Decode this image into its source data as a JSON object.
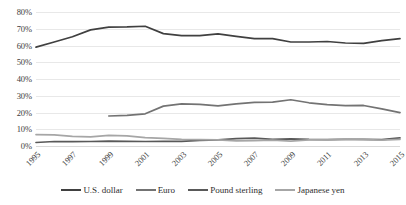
{
  "chart_data": {
    "type": "line",
    "title": "",
    "xlabel": "",
    "ylabel": "",
    "ylim": [
      0,
      80
    ],
    "ytick_labels": [
      "80%",
      "70%",
      "60%",
      "50%",
      "40%",
      "30%",
      "20%",
      "10%",
      "0%"
    ],
    "ytick_values": [
      80,
      70,
      60,
      50,
      40,
      30,
      20,
      10,
      0
    ],
    "grid": true,
    "legend_position": "bottom",
    "x": [
      1995,
      1996,
      1997,
      1998,
      1999,
      2000,
      2001,
      2002,
      2003,
      2004,
      2005,
      2006,
      2007,
      2008,
      2009,
      2010,
      2011,
      2012,
      2013,
      2014,
      2015
    ],
    "xtick_labels": [
      "1995",
      "1997",
      "1999",
      "2001",
      "2003",
      "2005",
      "2007",
      "2009",
      "2011",
      "2013",
      "2015"
    ],
    "xtick_values": [
      1995,
      1997,
      1999,
      2001,
      2003,
      2005,
      2007,
      2009,
      2011,
      2013,
      2015
    ],
    "series": [
      {
        "name": "U.S. dollar",
        "color": "#404040",
        "values": [
          59.0,
          62.1,
          65.2,
          69.3,
          71.0,
          71.1,
          71.5,
          67.1,
          65.9,
          65.9,
          66.9,
          65.5,
          64.1,
          64.1,
          62.1,
          62.1,
          62.4,
          61.5,
          61.3,
          62.9,
          64.1
        ]
      },
      {
        "name": "Euro",
        "color": "#737373",
        "values": [
          null,
          null,
          null,
          null,
          17.9,
          18.3,
          19.2,
          23.8,
          25.2,
          24.8,
          24.0,
          25.1,
          26.1,
          26.2,
          27.6,
          25.8,
          24.7,
          24.1,
          24.2,
          22.2,
          19.9
        ]
      },
      {
        "name": "Pound sterling",
        "color": "#595959",
        "values": [
          2.1,
          2.7,
          2.6,
          2.7,
          2.9,
          2.8,
          2.7,
          2.8,
          2.8,
          3.4,
          3.7,
          4.4,
          4.7,
          4.0,
          4.3,
          3.9,
          3.8,
          4.0,
          4.0,
          3.8,
          4.9
        ]
      },
      {
        "name": "Japanese yen",
        "color": "#a6a6a6",
        "values": [
          6.8,
          6.7,
          5.8,
          5.4,
          6.4,
          6.1,
          5.0,
          4.5,
          3.9,
          3.8,
          3.6,
          3.1,
          3.2,
          3.5,
          2.9,
          3.7,
          3.6,
          4.1,
          3.8,
          3.5,
          4.0
        ]
      }
    ]
  },
  "legend": {
    "items": [
      {
        "label": "U.S. dollar",
        "color": "#404040"
      },
      {
        "label": "Euro",
        "color": "#737373"
      },
      {
        "label": "Pound sterling",
        "color": "#595959"
      },
      {
        "label": "Japanese yen",
        "color": "#a6a6a6"
      }
    ]
  }
}
